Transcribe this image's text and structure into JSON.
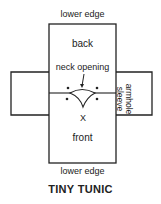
{
  "diagram": {
    "title": "TINY TUNIC",
    "labels": {
      "top_edge": "lower edge",
      "back": "back",
      "neck_opening": "neck opening",
      "center_mark": "X",
      "front": "front",
      "bottom_edge": "lower edge",
      "side_line1": "armhole",
      "side_line2": "sleeve"
    },
    "colors": {
      "line": "#222222",
      "background": "#ffffff"
    }
  }
}
